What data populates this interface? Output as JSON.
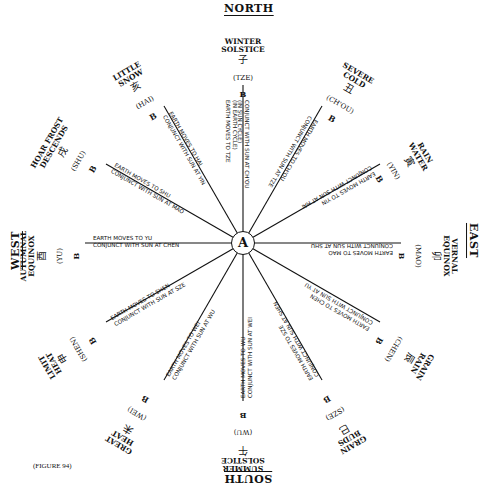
{
  "cardinals": {
    "north": "NORTH",
    "east": "EAST",
    "south": "SOUTH",
    "west": "WEST"
  },
  "hub": {
    "label": "A"
  },
  "caption": "(FIGURE 94)",
  "spokes": [
    {
      "id": "tze",
      "term": "WINTER\nSOLSTICE",
      "glyph": "子",
      "branch": "(TZE)",
      "marker": "B",
      "line1": "(IN EARTH CYCLE)",
      "line2": "EARTH MOVES TO TZE",
      "line3": "CONJUNCT WITH SUN AT CH'OU",
      "line4": "(IN SUN CYCLE)"
    },
    {
      "id": "chou",
      "term": "SEVERE\nCOLD",
      "glyph": "丑",
      "branch": "(CH'OU)",
      "marker": "B",
      "line1": "EARTH MOVES TO CH'OU",
      "line2": "CONJUNCT WITH SUN AT TZE"
    },
    {
      "id": "yin",
      "term": "RAIN\nWATER",
      "glyph": "寅",
      "branch": "(YIN)",
      "marker": "B",
      "line1": "EARTH MOVES TO YIN",
      "line2": "CONJUNCT WITH SUN AT HAI"
    },
    {
      "id": "mao",
      "term": "VERNAL\nEQUINOX",
      "glyph": "卯",
      "branch": "(MAO)",
      "marker": "B",
      "line1": "EARTH MOVES TO MAO",
      "line2": "CONJUNCT WITH SUN AT SHU"
    },
    {
      "id": "chen",
      "term": "GRAIN\nRAIN",
      "glyph": "辰",
      "branch": "(CHEN)",
      "marker": "B",
      "line1": "EARTH MOVES TO CHEN",
      "line2": "CONJUNCT WITH SUN AT YU"
    },
    {
      "id": "sze",
      "term": "GRAIN\nBUDS",
      "glyph": "巳",
      "branch": "(SZE)",
      "marker": "B",
      "line1": "EARTH MOVES TO SZE",
      "line2": "CONJUNCT WITH SUN AT SHEN"
    },
    {
      "id": "wu",
      "term": "SUMMER\nSOLSTICE",
      "glyph": "午",
      "branch": "(WU)",
      "marker": "B",
      "line1": "EARTH MOVES TO WU",
      "line2": "CONJUNCT WITH SUN AT WEI"
    },
    {
      "id": "wei",
      "term": "GREAT\nHEAT",
      "glyph": "未",
      "branch": "(WEI)",
      "marker": "B",
      "line1": "EARTH MOVES TO WEI",
      "line2": "CONJUNCT WITH SUN AT WU"
    },
    {
      "id": "shen",
      "term": "LIMIT\nHEAT",
      "glyph": "申",
      "branch": "(SHEN)",
      "marker": "B",
      "line1": "EARTH MOVES TO SHEN",
      "line2": "CONJUNCT WITH SUN AT SZE"
    },
    {
      "id": "yu",
      "term": "AUTUMNAL\nEQUINOX",
      "glyph": "酉",
      "branch": "(YU)",
      "marker": "B",
      "line1": "EARTH MOVES TO YU",
      "line2": "CONJUNCT WITH SUN AT CHEN"
    },
    {
      "id": "shu",
      "term": "HOAR FROST\nDESCENDS",
      "glyph": "戌",
      "branch": "(SHU)",
      "marker": "B",
      "line1": "EARTH MOVES TO SHU",
      "line2": "CONJUNCT WITH SUN AT MAO"
    },
    {
      "id": "hai",
      "term": "LITTLE\nSNOW",
      "glyph": "亥",
      "branch": "(HAI)",
      "marker": "B",
      "line1": "EARTH MOVES TO HAI",
      "line2": "CONJUNCT WITH SUN AT YIN"
    }
  ]
}
